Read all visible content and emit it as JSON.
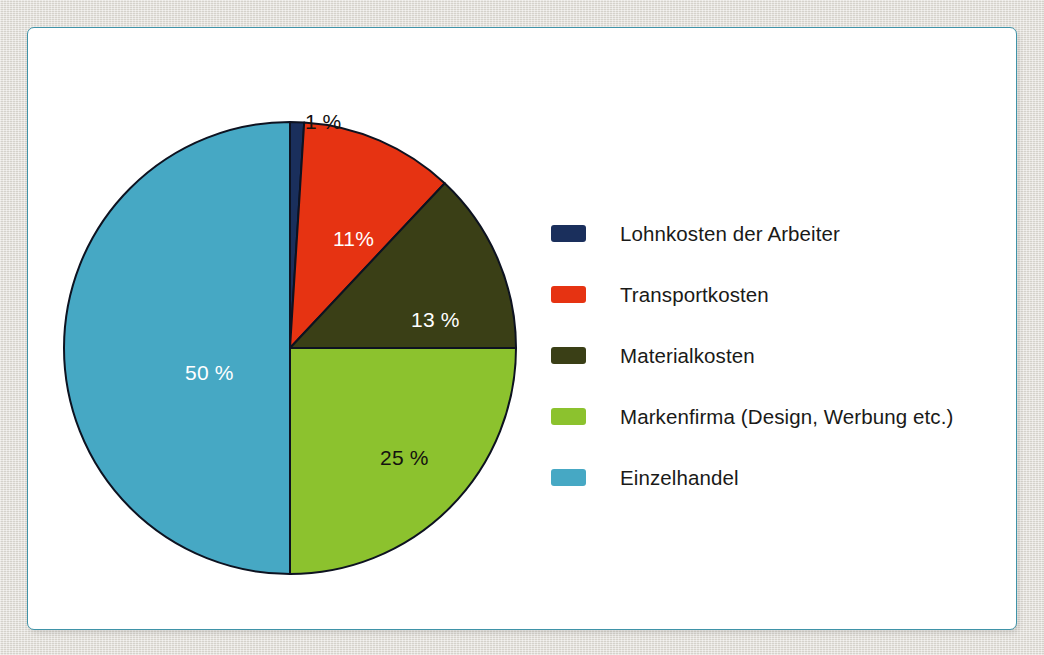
{
  "figure": {
    "panel_border_color": "#3f93a8",
    "panel_background": "#ffffff",
    "page_background": "#dedbd4"
  },
  "chart_data": {
    "type": "pie",
    "title": "",
    "subtitle": "",
    "xlabel": "",
    "ylabel": "",
    "legend_position": "right",
    "grid": false,
    "unit": "%",
    "start_angle_deg": 0,
    "direction": "clockwise",
    "categories": [
      "Lohnkosten der Arbeiter",
      "Transportkosten",
      "Materialkosten",
      "Markenfirma (Design, Werbung etc.)",
      "Einzelhandel"
    ],
    "values": [
      1,
      11,
      13,
      25,
      50
    ],
    "colors": [
      "#1a2f5c",
      "#e63312",
      "#3a3f16",
      "#8cc22e",
      "#46a8c4"
    ],
    "slices": [
      {
        "label": "Lohnkosten der Arbeiter",
        "value": 1,
        "value_label": "1 %",
        "color": "#1a2f5c",
        "label_color": "#14120f",
        "label_placement": "outside"
      },
      {
        "label": "Transportkosten",
        "value": 11,
        "value_label": "11%",
        "color": "#e63312",
        "label_color": "#ffffff",
        "label_placement": "inside"
      },
      {
        "label": "Materialkosten",
        "value": 13,
        "value_label": "13 %",
        "color": "#3a3f16",
        "label_color": "#ffffff",
        "label_placement": "inside"
      },
      {
        "label": "Markenfirma (Design, Werbung etc.)",
        "value": 25,
        "value_label": "25 %",
        "color": "#8cc22e",
        "label_color": "#14120f",
        "label_placement": "inside"
      },
      {
        "label": "Einzelhandel",
        "value": 50,
        "value_label": "50 %",
        "color": "#46a8c4",
        "label_color": "#ffffff",
        "label_placement": "inside"
      }
    ]
  },
  "legend": {
    "items": [
      {
        "label": "Lohnkosten der Arbeiter",
        "color": "#1a2f5c"
      },
      {
        "label": "Transportkosten",
        "color": "#e63312"
      },
      {
        "label": "Materialkosten",
        "color": "#3a3f16"
      },
      {
        "label": "Markenfirma (Design, Werbung etc.)",
        "color": "#8cc22e"
      },
      {
        "label": "Einzelhandel",
        "color": "#46a8c4"
      }
    ]
  }
}
